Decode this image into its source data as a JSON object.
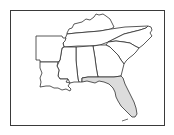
{
  "map": {
    "title": "Southeastern United States",
    "highlighted_state": "Florida",
    "colors": {
      "frame": "#3a3a3a",
      "outline": "#2f2f2f",
      "default_fill": "#ffffff",
      "highlight_fill": "#dcdcdc",
      "background": "#ffffff"
    },
    "states": [
      {
        "name": "Arkansas",
        "highlighted": false
      },
      {
        "name": "Louisiana",
        "highlighted": false
      },
      {
        "name": "Mississippi",
        "highlighted": false
      },
      {
        "name": "Alabama",
        "highlighted": false
      },
      {
        "name": "Georgia",
        "highlighted": false
      },
      {
        "name": "Florida",
        "highlighted": true
      },
      {
        "name": "Tennessee",
        "highlighted": false
      },
      {
        "name": "Kentucky",
        "highlighted": false
      },
      {
        "name": "North Carolina",
        "highlighted": false
      },
      {
        "name": "South Carolina",
        "highlighted": false
      }
    ]
  }
}
